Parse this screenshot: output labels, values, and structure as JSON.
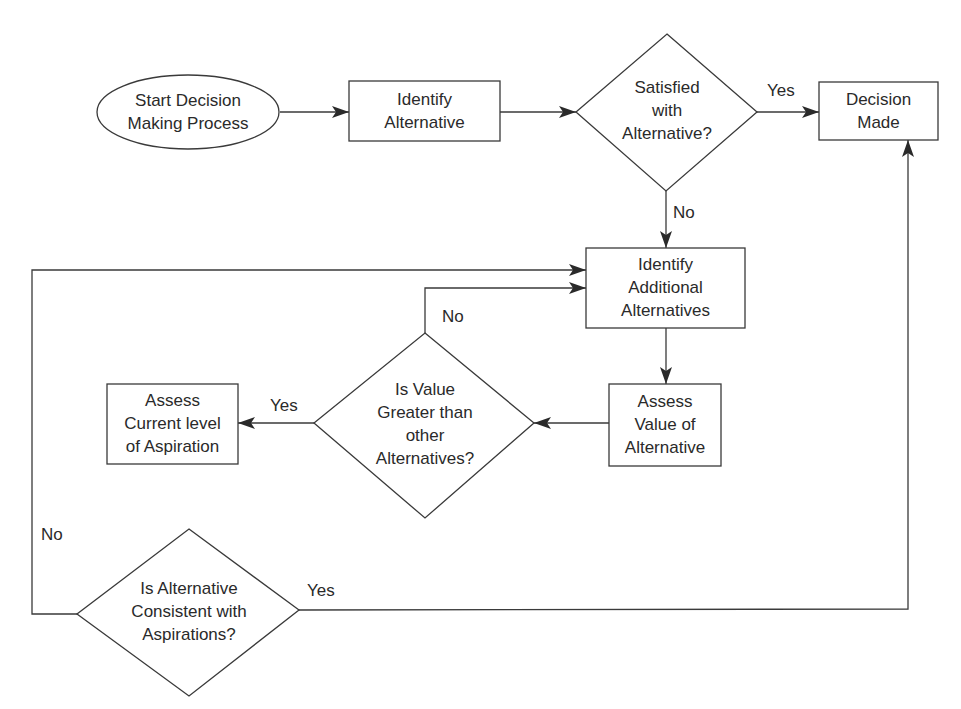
{
  "diagram": {
    "type": "flowchart",
    "nodes": {
      "start": {
        "shape": "ellipse",
        "text": "Start Decision\nMaking Process"
      },
      "identify_alternative": {
        "shape": "rectangle",
        "text": "Identify\nAlternative"
      },
      "satisfied": {
        "shape": "diamond",
        "text": "Satisfied\nwith\nAlternative?"
      },
      "decision_made": {
        "shape": "rectangle",
        "text": "Decision\nMade"
      },
      "identify_additional": {
        "shape": "rectangle",
        "text": "Identify\nAdditional\nAlternatives"
      },
      "assess_value": {
        "shape": "rectangle",
        "text": "Assess\nValue of\nAlternative"
      },
      "value_greater": {
        "shape": "diamond",
        "text": "Is Value\nGreater than\nother\nAlternatives?"
      },
      "assess_aspiration": {
        "shape": "rectangle",
        "text": "Assess\nCurrent level\nof Aspiration"
      },
      "consistent": {
        "shape": "diamond",
        "text": "Is Alternative\nConsistent with\nAspirations?"
      }
    },
    "edges": [
      {
        "from": "start",
        "to": "identify_alternative",
        "label": ""
      },
      {
        "from": "identify_alternative",
        "to": "satisfied",
        "label": ""
      },
      {
        "from": "satisfied",
        "to": "decision_made",
        "label": "Yes"
      },
      {
        "from": "satisfied",
        "to": "identify_additional",
        "label": "No"
      },
      {
        "from": "identify_additional",
        "to": "assess_value",
        "label": ""
      },
      {
        "from": "assess_value",
        "to": "value_greater",
        "label": ""
      },
      {
        "from": "value_greater",
        "to": "assess_aspiration",
        "label": "Yes"
      },
      {
        "from": "value_greater",
        "to": "identify_additional",
        "label": "No"
      },
      {
        "from": "consistent",
        "to": "decision_made",
        "label": "Yes"
      },
      {
        "from": "consistent",
        "to": "identify_additional",
        "label": "No"
      }
    ],
    "edge_labels": {
      "satisfied_yes": "Yes",
      "satisfied_no": "No",
      "value_greater_yes": "Yes",
      "value_greater_no": "No",
      "consistent_yes": "Yes",
      "consistent_no": "No"
    },
    "colors": {
      "stroke": "#3a3a3a",
      "text": "#2a2a2a",
      "background": "#ffffff"
    }
  }
}
